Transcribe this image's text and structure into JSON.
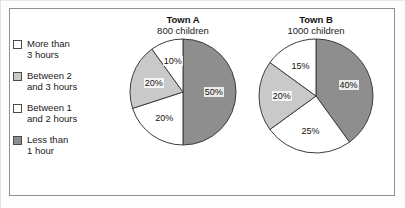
{
  "legend": {
    "items": [
      {
        "label": "More than\n3 hours",
        "swatch": "white",
        "color": "#ffffff"
      },
      {
        "label": "Between 2\nand 3 hours",
        "swatch": "light",
        "color": "#c9c9c9"
      },
      {
        "label": "Between 1\nand 2 hours",
        "swatch": "white",
        "color": "#ffffff"
      },
      {
        "label": "Less than\n1 hour",
        "swatch": "dark",
        "color": "#8e8e8e"
      }
    ]
  },
  "charts": {
    "a": {
      "title": "Town A",
      "subtitle": "800 children",
      "labels": [
        "50%",
        "20%",
        "20%",
        "10%"
      ]
    },
    "b": {
      "title": "Town B",
      "subtitle": "1000 children",
      "labels": [
        "40%",
        "25%",
        "20%",
        "15%"
      ]
    }
  },
  "chart_data": [
    {
      "type": "pie",
      "title": "Town A",
      "subtitle": "800 children",
      "total_children": 800,
      "start_angle_deg": 0,
      "direction": "clockwise",
      "categories": [
        "Less than 1 hour",
        "Between 1 and 2 hours",
        "Between 2 and 3 hours",
        "More than 3 hours"
      ],
      "values": [
        50,
        20,
        20,
        10
      ],
      "value_labels": [
        "50%",
        "20%",
        "20%",
        "10%"
      ],
      "colors": [
        "#8e8e8e",
        "#ffffff",
        "#c9c9c9",
        "#ffffff"
      ],
      "units": "percent",
      "legend_position": "left"
    },
    {
      "type": "pie",
      "title": "Town B",
      "subtitle": "1000 children",
      "total_children": 1000,
      "start_angle_deg": 0,
      "direction": "clockwise",
      "categories": [
        "Less than 1 hour",
        "Between 1 and 2 hours",
        "Between 2 and 3 hours",
        "More than 3 hours"
      ],
      "values": [
        40,
        25,
        20,
        15
      ],
      "value_labels": [
        "40%",
        "25%",
        "20%",
        "15%"
      ],
      "colors": [
        "#8e8e8e",
        "#ffffff",
        "#c9c9c9",
        "#ffffff"
      ],
      "units": "percent",
      "legend_position": "left"
    }
  ]
}
